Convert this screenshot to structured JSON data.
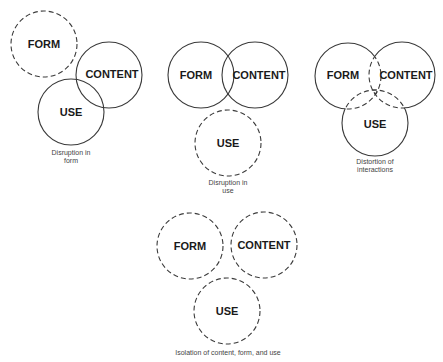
{
  "diagrams": [
    {
      "id": "disruption-form",
      "circles": [
        {
          "label": "FORM",
          "cx": 44,
          "cy": 44,
          "r": 33,
          "style": "dashed"
        },
        {
          "label": "CONTENT",
          "cx": 109,
          "cy": 75,
          "r": 33,
          "style": "solid"
        },
        {
          "label": "USE",
          "cx": 71,
          "cy": 112,
          "r": 33,
          "style": "solid"
        }
      ],
      "caption": [
        "Disruption in",
        "form"
      ]
    },
    {
      "id": "disruption-use",
      "circles": [
        {
          "label": "FORM",
          "cx": 201,
          "cy": 75,
          "r": 33,
          "style": "solid"
        },
        {
          "label": "CONTENT",
          "cx": 255,
          "cy": 75,
          "r": 33,
          "style": "solid"
        },
        {
          "label": "USE",
          "cx": 228,
          "cy": 143,
          "r": 33,
          "style": "dashed"
        }
      ],
      "caption": [
        "Disruption in",
        "use"
      ]
    },
    {
      "id": "distortion-interactions",
      "circles": [
        {
          "label": "FORM",
          "cx": 348,
          "cy": 76,
          "r": 33,
          "style": "solid-outer-dashed-overlap"
        },
        {
          "label": "CONTENT",
          "cx": 402,
          "cy": 75,
          "r": 33,
          "style": "solid-outer-dashed-overlap"
        },
        {
          "label": "USE",
          "cx": 375,
          "cy": 123,
          "r": 33,
          "style": "solid-outer-dashed-overlap"
        }
      ],
      "caption": [
        "Distortion of",
        "interactions"
      ]
    },
    {
      "id": "isolation",
      "circles": [
        {
          "label": "FORM",
          "cx": 190,
          "cy": 246,
          "r": 33,
          "style": "dashed"
        },
        {
          "label": "CONTENT",
          "cx": 264,
          "cy": 245,
          "r": 33,
          "style": "dashed"
        },
        {
          "label": "USE",
          "cx": 227,
          "cy": 311,
          "r": 33,
          "style": "dashed"
        }
      ],
      "caption": [
        "Isolation of content, form, and use"
      ]
    }
  ],
  "colors": {
    "stroke": "#3a3a3a",
    "text": "#1a1a1a",
    "caption": "#444444",
    "background": "#ffffff"
  }
}
